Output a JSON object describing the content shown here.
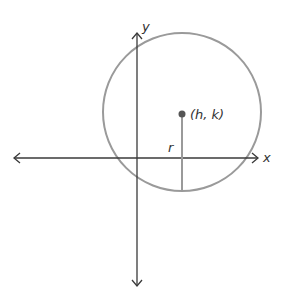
{
  "diagram": {
    "axes": {
      "x_label": "x",
      "y_label": "y",
      "color": "#3a3a3a"
    },
    "circle": {
      "color": "#9a9a9a"
    },
    "center": {
      "label": "(h, k)",
      "color": "#555555"
    },
    "radius": {
      "label": "r",
      "color": "#9a9a9a"
    }
  }
}
